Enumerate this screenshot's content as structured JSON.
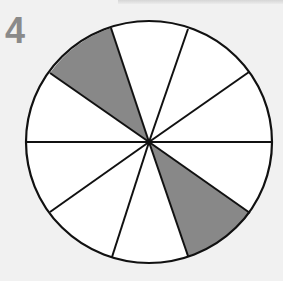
{
  "problem": {
    "number": "4"
  },
  "diagram": {
    "type": "fraction-circle",
    "total_parts": 10,
    "shaded_parts": 2,
    "center": [
      149,
      142
    ],
    "radius_x": 123,
    "radius_y": 121,
    "colors": {
      "background": "#f1f1f1",
      "fill": "#ffffff",
      "shaded": "#888888",
      "stroke": "#111111",
      "number": "#8a8a8a"
    },
    "spokes": [
      [
        111,
        28
      ],
      [
        188,
        29
      ],
      [
        249,
        72
      ],
      [
        272,
        142
      ],
      [
        250,
        213
      ],
      [
        188,
        256
      ],
      [
        112,
        257
      ],
      [
        50,
        212
      ],
      [
        26,
        142
      ],
      [
        50,
        73
      ]
    ],
    "shaded_wedges": [
      {
        "from": [
          50,
          73
        ],
        "to": [
          111,
          28
        ]
      },
      {
        "from": [
          250,
          213
        ],
        "to": [
          188,
          256
        ]
      }
    ]
  }
}
